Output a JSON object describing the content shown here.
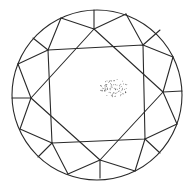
{
  "diagram": {
    "title": "Round brilliant cut diamond plot (crown view)",
    "line_color": "#2a2a2a",
    "background": "#ffffff",
    "girdle": {
      "cx": 97,
      "cy": 95,
      "r": 85
    },
    "table": [
      [
        48,
        50
      ],
      [
        143,
        45
      ],
      [
        145,
        139
      ],
      [
        52,
        143
      ]
    ],
    "star_square": [
      [
        94,
        29
      ],
      [
        163,
        92
      ],
      [
        100,
        160
      ],
      [
        31,
        98
      ]
    ],
    "girdle_points": [
      [
        94,
        10
      ],
      [
        126,
        14
      ],
      [
        173,
        57
      ],
      [
        182,
        91
      ],
      [
        177,
        124
      ],
      [
        135,
        171
      ],
      [
        100,
        178
      ],
      [
        68,
        174
      ],
      [
        38,
        157
      ],
      [
        20,
        129
      ],
      [
        12,
        98
      ],
      [
        18,
        64
      ],
      [
        33,
        38
      ],
      [
        61,
        18
      ]
    ],
    "facet_lines": [
      [
        [
          94,
          29
        ],
        [
          94,
          10
        ]
      ],
      [
        [
          94,
          29
        ],
        [
          61,
          18
        ]
      ],
      [
        [
          94,
          29
        ],
        [
          126,
          14
        ]
      ],
      [
        [
          48,
          50
        ],
        [
          61,
          18
        ]
      ],
      [
        [
          48,
          50
        ],
        [
          33,
          38
        ]
      ],
      [
        [
          48,
          50
        ],
        [
          18,
          64
        ]
      ],
      [
        [
          143,
          45
        ],
        [
          126,
          14
        ]
      ],
      [
        [
          143,
          45
        ],
        [
          173,
          57
        ]
      ],
      [
        [
          143,
          45
        ],
        [
          160,
          30
        ]
      ],
      [
        [
          163,
          92
        ],
        [
          173,
          57
        ]
      ],
      [
        [
          163,
          92
        ],
        [
          182,
          91
        ]
      ],
      [
        [
          163,
          92
        ],
        [
          177,
          124
        ]
      ],
      [
        [
          145,
          139
        ],
        [
          177,
          124
        ]
      ],
      [
        [
          145,
          139
        ],
        [
          160,
          153
        ]
      ],
      [
        [
          145,
          139
        ],
        [
          135,
          171
        ]
      ],
      [
        [
          100,
          160
        ],
        [
          135,
          171
        ]
      ],
      [
        [
          100,
          160
        ],
        [
          100,
          178
        ]
      ],
      [
        [
          100,
          160
        ],
        [
          68,
          174
        ]
      ],
      [
        [
          52,
          143
        ],
        [
          68,
          174
        ]
      ],
      [
        [
          52,
          143
        ],
        [
          38,
          157
        ]
      ],
      [
        [
          52,
          143
        ],
        [
          20,
          129
        ]
      ],
      [
        [
          31,
          98
        ],
        [
          20,
          129
        ]
      ],
      [
        [
          31,
          98
        ],
        [
          12,
          98
        ]
      ],
      [
        [
          31,
          98
        ],
        [
          18,
          64
        ]
      ]
    ],
    "inclusion": {
      "type": "pinpoint cluster",
      "label": "Cloud of pinpoints",
      "center": [
        114,
        88
      ],
      "rx": 14,
      "ry": 9,
      "count": 90,
      "color": "#3a3a3a"
    }
  }
}
